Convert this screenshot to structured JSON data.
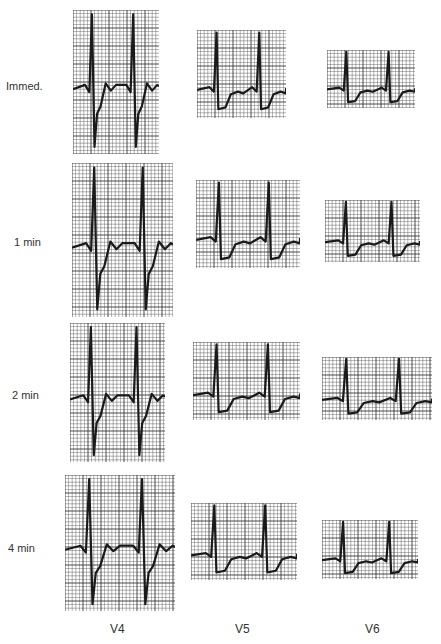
{
  "figure": {
    "row_labels": [
      "Immed.",
      "1 min",
      "2 min",
      "4 min"
    ],
    "column_labels": [
      "V4",
      "V5",
      "V6"
    ],
    "panels": [
      {
        "row": "Immed.",
        "lead": "V4",
        "x": 73,
        "y": 10,
        "w": 86,
        "h": 144
      },
      {
        "row": "Immed.",
        "lead": "V5",
        "x": 197,
        "y": 30,
        "w": 89,
        "h": 88
      },
      {
        "row": "Immed.",
        "lead": "V6",
        "x": 327,
        "y": 50,
        "w": 88,
        "h": 58
      },
      {
        "row": "1 min",
        "lead": "V4",
        "x": 72,
        "y": 163,
        "w": 101,
        "h": 154
      },
      {
        "row": "1 min",
        "lead": "V5",
        "x": 196,
        "y": 180,
        "w": 104,
        "h": 88
      },
      {
        "row": "1 min",
        "lead": "V6",
        "x": 325,
        "y": 200,
        "w": 95,
        "h": 62
      },
      {
        "row": "2 min",
        "lead": "V4",
        "x": 70,
        "y": 323,
        "w": 95,
        "h": 139
      },
      {
        "row": "2 min",
        "lead": "V5",
        "x": 193,
        "y": 342,
        "w": 107,
        "h": 78
      },
      {
        "row": "2 min",
        "lead": "V6",
        "x": 322,
        "y": 357,
        "w": 110,
        "h": 63
      },
      {
        "row": "4 min",
        "lead": "V4",
        "x": 65,
        "y": 475,
        "w": 110,
        "h": 136
      },
      {
        "row": "4 min",
        "lead": "V5",
        "x": 191,
        "y": 503,
        "w": 106,
        "h": 77
      },
      {
        "row": "4 min",
        "lead": "V6",
        "x": 322,
        "y": 520,
        "w": 96,
        "h": 59
      }
    ]
  },
  "colors": {
    "grid": "#3a3a3a",
    "trace": "#1a1a1a",
    "background": "#ffffff"
  }
}
